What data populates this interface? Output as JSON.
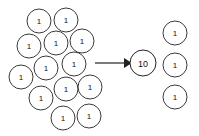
{
  "diagram": {
    "background_color": "#ffffff",
    "stroke_color": "#3a3a3a",
    "text_color": "#111111",
    "width": 199,
    "height": 136,
    "left_group": {
      "label": "ones-cluster",
      "count": 13,
      "circles": [
        {
          "label": "1",
          "cx": 39,
          "cy": 21,
          "r": 12
        },
        {
          "label": "1",
          "cx": 66,
          "cy": 20,
          "r": 12
        },
        {
          "label": "1",
          "cx": 29,
          "cy": 46,
          "r": 12
        },
        {
          "label": "1",
          "cx": 56,
          "cy": 43,
          "r": 12
        },
        {
          "label": "1",
          "cx": 82,
          "cy": 41,
          "r": 12
        },
        {
          "label": "1",
          "cx": 46,
          "cy": 68,
          "r": 12
        },
        {
          "label": "1",
          "cx": 74,
          "cy": 64,
          "r": 12
        },
        {
          "label": "1",
          "cx": 21,
          "cy": 77,
          "r": 12
        },
        {
          "label": "1",
          "cx": 66,
          "cy": 89,
          "r": 12
        },
        {
          "label": "1",
          "cx": 90,
          "cy": 87,
          "r": 12
        },
        {
          "label": "1",
          "cx": 41,
          "cy": 98,
          "r": 12
        },
        {
          "label": "1",
          "cx": 63,
          "cy": 118,
          "r": 12
        },
        {
          "label": "1",
          "cx": 89,
          "cy": 116,
          "r": 12
        }
      ]
    },
    "arrow": {
      "label": "transforms-into",
      "x1": 95,
      "y1": 63,
      "x2": 124,
      "y2": 63,
      "head_points": "124,58 132,63 124,68"
    },
    "ten_circle": {
      "label": "10",
      "cx": 143,
      "cy": 63,
      "r": 13
    },
    "right_group": {
      "label": "remaining-ones",
      "count": 3,
      "circles": [
        {
          "label": "1",
          "cx": 175,
          "cy": 33,
          "r": 12
        },
        {
          "label": "1",
          "cx": 175,
          "cy": 65,
          "r": 12
        },
        {
          "label": "1",
          "cx": 175,
          "cy": 97,
          "r": 12
        }
      ]
    }
  },
  "chart_data": {
    "type": "diagram",
    "groups": [
      {
        "name": "left-ones",
        "value_per_item": 1,
        "item_count": 13,
        "total": 13
      },
      {
        "name": "ten-rod",
        "value_per_item": 10,
        "item_count": 1,
        "total": 10
      },
      {
        "name": "right-ones",
        "value_per_item": 1,
        "item_count": 3,
        "total": 3
      }
    ],
    "relation": "13 ones  →  1 ten + 3 ones"
  }
}
